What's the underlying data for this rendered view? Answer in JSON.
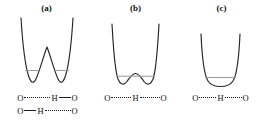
{
  "figure": {
    "background_color": "#ffffff",
    "curve_color": "#262626",
    "level_color": "#9a9a9a",
    "text_color": "#111111"
  },
  "panels": [
    {
      "key": "a",
      "label": "(a)",
      "description": "asymmetric double-well potential with high central barrier",
      "well_type": "double-well-high-barrier",
      "energy_levels": 2,
      "formula_rows": [
        {
          "left_atom": "O",
          "left_bond": "dotted",
          "center_atom": "H",
          "right_bond": "solid",
          "right_atom": "O"
        },
        {
          "left_atom": "O",
          "left_bond": "solid",
          "center_atom": "H",
          "right_bond": "dotted",
          "right_atom": "O"
        }
      ]
    },
    {
      "key": "b",
      "label": "(b)",
      "description": "symmetric double-well potential with low central barrier",
      "well_type": "double-well-low-barrier",
      "energy_levels": 1,
      "formula_rows": [
        {
          "left_atom": "O",
          "left_bond": "dotted",
          "center_atom": "H",
          "right_bond": "dotted",
          "right_atom": "O"
        }
      ]
    },
    {
      "key": "c",
      "label": "(c)",
      "description": "single-well symmetric potential",
      "well_type": "single-well",
      "energy_levels": 1,
      "formula_rows": [
        {
          "left_atom": "O",
          "left_bond": "dotted-thick",
          "center_atom": "H",
          "right_bond": "dotted-thick",
          "right_atom": "O"
        }
      ]
    }
  ]
}
